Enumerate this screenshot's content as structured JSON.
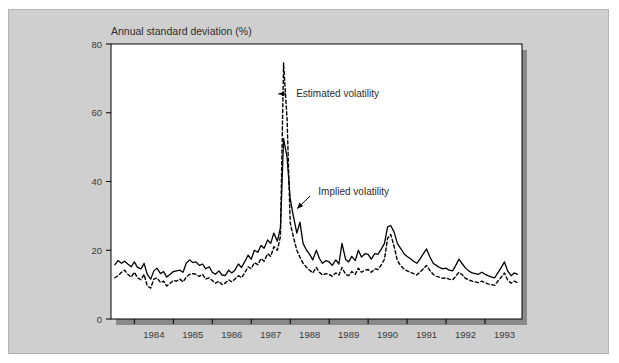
{
  "figure": {
    "background_color": "#ffffff",
    "panel_color": "#cfcfcf",
    "panel_border_color": "#b3b3b3",
    "plot_background_color": "#ffffff",
    "plot_border_color": "#000000",
    "shadow_color": "#8a8a8a"
  },
  "chart_data": {
    "type": "line",
    "title": "",
    "ylabel": "Annual standard deviation (%)",
    "xlabel": "",
    "ylim": [
      0,
      80
    ],
    "yticks": [
      0,
      20,
      40,
      60,
      80
    ],
    "ytick_labels": [
      "0",
      "20",
      "40",
      "60",
      "80"
    ],
    "xlim": [
      1983.4,
      1993.95
    ],
    "xtick_years": [
      1984,
      1985,
      1986,
      1987,
      1988,
      1989,
      1990,
      1991,
      1992,
      1993
    ],
    "xtick_labels": [
      "1984",
      "1985",
      "1986",
      "1987",
      "1988",
      "1989",
      "1990",
      "1991",
      "1992",
      "1993"
    ],
    "grid": false,
    "legend_position": "inline-annotations",
    "annotations": [
      {
        "text": "Estimated volatility",
        "target_x": 1987.62,
        "target_y": 65.5,
        "text_x": 1988.05,
        "text_y": 65.5,
        "style": "dashed-series-callout"
      },
      {
        "text": "Implied volatility",
        "target_x": 1988.12,
        "target_y": 31.5,
        "text_x": 1988.62,
        "text_y": 37.0,
        "style": "solid-series-callout"
      }
    ],
    "series": [
      {
        "name": "Implied volatility",
        "style": "solid",
        "color": "#000000",
        "x": [
          1983.5,
          1983.58,
          1983.67,
          1983.75,
          1983.83,
          1983.92,
          1984.0,
          1984.08,
          1984.17,
          1984.25,
          1984.33,
          1984.42,
          1984.5,
          1984.58,
          1984.67,
          1984.75,
          1984.83,
          1984.92,
          1985.0,
          1985.08,
          1985.17,
          1985.25,
          1985.33,
          1985.42,
          1985.5,
          1985.58,
          1985.67,
          1985.75,
          1985.83,
          1985.92,
          1986.0,
          1986.08,
          1986.17,
          1986.25,
          1986.33,
          1986.42,
          1986.5,
          1986.58,
          1986.67,
          1986.75,
          1986.83,
          1986.92,
          1987.0,
          1987.08,
          1987.17,
          1987.25,
          1987.33,
          1987.42,
          1987.5,
          1987.58,
          1987.67,
          1987.75,
          1987.83,
          1987.92,
          1988.0,
          1988.08,
          1988.17,
          1988.25,
          1988.33,
          1988.42,
          1988.5,
          1988.58,
          1988.67,
          1988.75,
          1988.83,
          1988.92,
          1989.0,
          1989.08,
          1989.17,
          1989.25,
          1989.33,
          1989.42,
          1989.5,
          1989.58,
          1989.67,
          1989.75,
          1989.83,
          1989.92,
          1990.0,
          1990.08,
          1990.17,
          1990.25,
          1990.33,
          1990.42,
          1990.5,
          1990.58,
          1990.67,
          1990.75,
          1990.83,
          1990.92,
          1991.0,
          1991.08,
          1991.17,
          1991.25,
          1991.33,
          1991.42,
          1991.5,
          1991.58,
          1991.67,
          1991.75,
          1991.83,
          1991.92,
          1992.0,
          1992.08,
          1992.17,
          1992.25,
          1992.33,
          1992.42,
          1992.5,
          1992.58,
          1992.67,
          1992.75,
          1992.83,
          1992.92,
          1993.0,
          1993.08,
          1993.17,
          1993.25,
          1993.33,
          1993.42,
          1993.5,
          1993.58,
          1993.67,
          1993.75,
          1993.83
        ],
        "values": [
          15.8,
          17.0,
          16.2,
          16.8,
          16.0,
          15.2,
          16.6,
          15.0,
          14.6,
          16.2,
          13.0,
          11.6,
          14.0,
          14.8,
          13.2,
          13.8,
          12.2,
          13.0,
          13.8,
          14.0,
          14.2,
          13.6,
          16.2,
          17.2,
          16.4,
          16.6,
          15.6,
          16.0,
          14.6,
          15.2,
          13.6,
          13.0,
          14.0,
          12.8,
          12.6,
          14.2,
          13.4,
          14.2,
          16.0,
          15.0,
          16.6,
          18.6,
          17.4,
          20.0,
          19.4,
          21.4,
          20.6,
          23.0,
          22.0,
          25.0,
          22.6,
          26.6,
          52.5,
          47.0,
          35.0,
          30.0,
          25.0,
          28.2,
          22.0,
          20.0,
          18.8,
          17.2,
          20.0,
          17.6,
          16.2,
          17.0,
          16.6,
          15.6,
          17.2,
          16.0,
          22.0,
          17.4,
          16.6,
          18.2,
          17.0,
          20.0,
          18.0,
          19.0,
          18.8,
          17.4,
          19.0,
          18.8,
          20.2,
          22.0,
          26.8,
          27.2,
          25.2,
          22.0,
          20.6,
          19.0,
          18.2,
          17.6,
          16.8,
          16.2,
          17.4,
          19.0,
          20.4,
          18.2,
          16.2,
          15.6,
          15.0,
          14.6,
          14.8,
          14.2,
          14.0,
          15.6,
          17.4,
          16.0,
          14.8,
          14.0,
          13.4,
          13.2,
          13.0,
          13.6,
          13.0,
          12.6,
          12.2,
          12.0,
          13.4,
          15.0,
          16.6,
          14.0,
          12.6,
          13.4,
          13.0
        ]
      },
      {
        "name": "Estimated volatility",
        "style": "dashed",
        "color": "#000000",
        "x": [
          1983.5,
          1983.58,
          1983.67,
          1983.75,
          1983.83,
          1983.92,
          1984.0,
          1984.08,
          1984.17,
          1984.25,
          1984.33,
          1984.42,
          1984.5,
          1984.58,
          1984.67,
          1984.75,
          1984.83,
          1984.92,
          1985.0,
          1985.08,
          1985.17,
          1985.25,
          1985.33,
          1985.42,
          1985.5,
          1985.58,
          1985.67,
          1985.75,
          1985.83,
          1985.92,
          1986.0,
          1986.08,
          1986.17,
          1986.25,
          1986.33,
          1986.42,
          1986.5,
          1986.58,
          1986.67,
          1986.75,
          1986.83,
          1986.92,
          1987.0,
          1987.08,
          1987.17,
          1987.25,
          1987.33,
          1987.42,
          1987.5,
          1987.58,
          1987.67,
          1987.75,
          1987.83,
          1987.92,
          1988.0,
          1988.08,
          1988.17,
          1988.25,
          1988.33,
          1988.42,
          1988.5,
          1988.58,
          1988.67,
          1988.75,
          1988.83,
          1988.92,
          1989.0,
          1989.08,
          1989.17,
          1989.25,
          1989.33,
          1989.42,
          1989.5,
          1989.58,
          1989.67,
          1989.75,
          1989.83,
          1989.92,
          1990.0,
          1990.08,
          1990.17,
          1990.25,
          1990.33,
          1990.42,
          1990.5,
          1990.58,
          1990.67,
          1990.75,
          1990.83,
          1990.92,
          1991.0,
          1991.08,
          1991.17,
          1991.25,
          1991.33,
          1991.42,
          1991.5,
          1991.58,
          1991.67,
          1991.75,
          1991.83,
          1991.92,
          1992.0,
          1992.08,
          1992.17,
          1992.25,
          1992.33,
          1992.42,
          1992.5,
          1992.58,
          1992.67,
          1992.75,
          1992.83,
          1992.92,
          1993.0,
          1993.08,
          1993.17,
          1993.25,
          1993.33,
          1993.42,
          1993.5,
          1993.58,
          1993.67,
          1993.75,
          1993.83
        ],
        "values": [
          12.0,
          12.6,
          13.6,
          14.2,
          13.0,
          12.2,
          13.6,
          12.0,
          11.4,
          13.0,
          9.6,
          9.0,
          11.6,
          12.0,
          10.6,
          11.0,
          9.6,
          10.4,
          11.2,
          11.0,
          11.6,
          10.8,
          12.2,
          13.0,
          13.2,
          13.0,
          12.4,
          13.0,
          11.6,
          12.0,
          11.2,
          10.4,
          11.0,
          10.0,
          10.4,
          11.4,
          10.8,
          11.6,
          12.6,
          12.0,
          13.4,
          15.2,
          14.6,
          16.4,
          15.8,
          17.6,
          16.8,
          19.0,
          18.2,
          21.0,
          20.0,
          24.0,
          74.5,
          58.0,
          28.0,
          24.0,
          20.0,
          18.0,
          16.2,
          15.0,
          14.2,
          13.4,
          15.0,
          13.6,
          12.8,
          13.2,
          13.0,
          12.4,
          13.4,
          12.8,
          15.0,
          13.0,
          12.6,
          13.8,
          13.0,
          14.8,
          13.6,
          14.2,
          14.4,
          13.6,
          14.6,
          14.4,
          15.6,
          17.4,
          23.5,
          24.6,
          21.0,
          17.0,
          15.6,
          14.6,
          14.0,
          13.6,
          13.2,
          12.8,
          13.6,
          14.6,
          15.6,
          14.2,
          13.0,
          12.4,
          12.2,
          11.8,
          12.0,
          11.6,
          11.4,
          12.4,
          13.6,
          12.8,
          11.8,
          11.4,
          11.0,
          10.8,
          10.6,
          11.0,
          10.6,
          10.2,
          10.0,
          9.8,
          11.0,
          12.2,
          13.4,
          11.4,
          10.4,
          11.0,
          10.6
        ]
      }
    ]
  }
}
